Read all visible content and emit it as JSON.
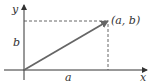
{
  "diagram": {
    "type": "vector-in-plane",
    "axes": {
      "x_label": "x",
      "y_label": "y"
    },
    "point_label": "(a, b)",
    "horizontal_component_label": "a",
    "vertical_component_label": "b",
    "colors": {
      "axis": "#333333",
      "vector": "#666666",
      "dashed": "#555555"
    }
  }
}
